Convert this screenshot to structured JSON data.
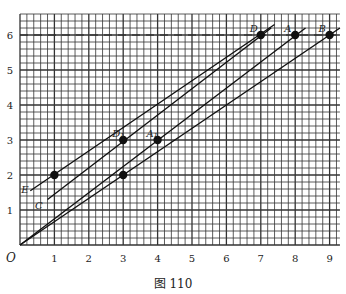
{
  "figure": {
    "caption": "图 110"
  },
  "chart_data": {
    "type": "line",
    "title": "",
    "xlabel": "",
    "ylabel": "",
    "origin_label": "O",
    "xlim": [
      0,
      9.3
    ],
    "ylim": [
      0,
      6.6
    ],
    "x_ticks": [
      "1",
      "2",
      "3",
      "4",
      "5",
      "6",
      "7",
      "8",
      "9"
    ],
    "y_ticks": [
      "1",
      "2",
      "3",
      "4",
      "5",
      "6"
    ],
    "grid": {
      "on": true,
      "minor_step": 0.2,
      "major_step": 1
    },
    "reference_line": {
      "type": "dashed-horizontal",
      "y": 6
    },
    "points": [
      {
        "label": "",
        "x": 1,
        "y": 2
      },
      {
        "label": "D₁",
        "x": 3,
        "y": 3
      },
      {
        "label": "",
        "x": 3,
        "y": 2
      },
      {
        "label": "A₁",
        "x": 4,
        "y": 3
      },
      {
        "label": "D",
        "x": 7,
        "y": 6
      },
      {
        "label": "A",
        "x": 8,
        "y": 6
      },
      {
        "label": "B",
        "x": 9,
        "y": 6
      }
    ],
    "series": [
      {
        "name": "E",
        "x": [
          0.3,
          7.4
        ],
        "y": [
          1.55,
          6.3
        ]
      },
      {
        "name": "C",
        "x": [
          0.8,
          7.3
        ],
        "y": [
          1.3,
          6.2
        ]
      },
      {
        "name": "OA",
        "x": [
          0,
          8.3
        ],
        "y": [
          0,
          6.2
        ]
      },
      {
        "name": "OB",
        "x": [
          0,
          9.3
        ],
        "y": [
          0,
          6.2
        ]
      }
    ],
    "line_labels": [
      {
        "label": "E",
        "x": 0.15,
        "y": 1.6
      },
      {
        "label": "C",
        "x": 0.55,
        "y": 1.15
      }
    ]
  }
}
